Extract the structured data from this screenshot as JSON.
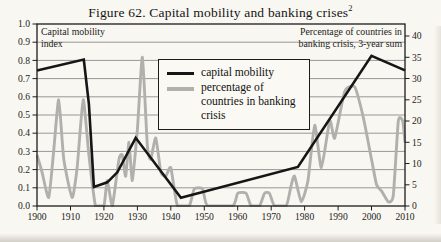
{
  "figure": {
    "title": "Figure 62. Capital mobility and banking crises",
    "footnote_marker": "2"
  },
  "plot": {
    "left_axis_label_line1": "Capital mobility",
    "left_axis_label_line2": "index",
    "right_axis_label_line1": "Percentage of countries in",
    "right_axis_label_line2": "banking crisis, 3-year sum",
    "left_ticks": [
      "1.0",
      "0.9",
      "0.8",
      "0.7",
      "0.6",
      "0.5",
      "0.4",
      "0.3",
      "0.2",
      "0.1",
      "0.0"
    ],
    "right_ticks": [
      "40",
      "35",
      "30",
      "25",
      "20",
      "15",
      "10",
      "5",
      "0"
    ],
    "x_ticks": [
      "1900",
      "1910",
      "1920",
      "1930",
      "1940",
      "1950",
      "1960",
      "1970",
      "1980",
      "1990",
      "2000",
      "2010"
    ]
  },
  "legend": {
    "items": [
      {
        "label": "capital mobility",
        "color": "#161616"
      },
      {
        "label": "percentage of countries in banking crisis",
        "color": "#b1b0ad"
      }
    ]
  },
  "chart_data": {
    "type": "line",
    "title": "Figure 62. Capital mobility and banking crises",
    "xlim": [
      1900,
      2010
    ],
    "x_tick_step": 10,
    "grid": "horizontal lines at left-axis 0.1 steps",
    "left_axis": {
      "label": "Capital mobility index",
      "ylim": [
        0,
        1
      ],
      "tick_step": 0.1
    },
    "right_axis": {
      "label": "Percentage of countries in banking crisis, 3-year sum",
      "ylim": [
        0,
        40
      ],
      "tick_step": 5
    },
    "series": [
      {
        "name": "capital mobility",
        "axis": "left",
        "color": "#161616",
        "style": "straight",
        "points": [
          [
            1900,
            0.745
          ],
          [
            1914,
            0.805
          ],
          [
            1915.5,
            0.56
          ],
          [
            1917,
            0.105
          ],
          [
            1921,
            0.13
          ],
          [
            1924,
            0.185
          ],
          [
            1929.5,
            0.375
          ],
          [
            1943,
            0.045
          ],
          [
            1978,
            0.215
          ],
          [
            2000,
            0.825
          ],
          [
            2010,
            0.745
          ]
        ]
      },
      {
        "name": "percentage of countries in banking crisis",
        "axis": "right",
        "color": "#b1b0ad",
        "style": "smooth",
        "points": [
          [
            1900,
            12
          ],
          [
            1901.5,
            8
          ],
          [
            1903.5,
            2
          ],
          [
            1905,
            13
          ],
          [
            1906.5,
            25
          ],
          [
            1908,
            11
          ],
          [
            1910.5,
            2
          ],
          [
            1912,
            9
          ],
          [
            1913.8,
            25
          ],
          [
            1915.5,
            12
          ],
          [
            1917.5,
            0
          ],
          [
            1920,
            0
          ],
          [
            1921,
            6
          ],
          [
            1922.5,
            0
          ],
          [
            1924.5,
            11
          ],
          [
            1925.5,
            12
          ],
          [
            1926.5,
            7
          ],
          [
            1927.5,
            15
          ],
          [
            1928.5,
            6
          ],
          [
            1930,
            18
          ],
          [
            1931.5,
            35
          ],
          [
            1933,
            14
          ],
          [
            1934,
            11
          ],
          [
            1935.5,
            16
          ],
          [
            1937,
            8
          ],
          [
            1938.5,
            7
          ],
          [
            1940,
            9
          ],
          [
            1942,
            0
          ],
          [
            1945.5,
            0
          ],
          [
            1947,
            4
          ],
          [
            1949.5,
            4
          ],
          [
            1951,
            0
          ],
          [
            1958.5,
            0
          ],
          [
            1960,
            3
          ],
          [
            1962.5,
            3
          ],
          [
            1964,
            0
          ],
          [
            1966.5,
            0
          ],
          [
            1968,
            3
          ],
          [
            1969.5,
            3
          ],
          [
            1971,
            0
          ],
          [
            1974.5,
            0
          ],
          [
            1976,
            5
          ],
          [
            1977,
            7
          ],
          [
            1979,
            1
          ],
          [
            1981,
            6
          ],
          [
            1983,
            19
          ],
          [
            1985,
            9
          ],
          [
            1987.5,
            20
          ],
          [
            1989,
            16
          ],
          [
            1992,
            27
          ],
          [
            1995,
            28
          ],
          [
            1997.5,
            21
          ],
          [
            2000,
            11
          ],
          [
            2001.5,
            5
          ],
          [
            2003,
            3.5
          ],
          [
            2005,
            1
          ],
          [
            2006.5,
            2.5
          ],
          [
            2008,
            20
          ],
          [
            2009.3,
            20
          ],
          [
            2010,
            15
          ]
        ]
      }
    ]
  }
}
